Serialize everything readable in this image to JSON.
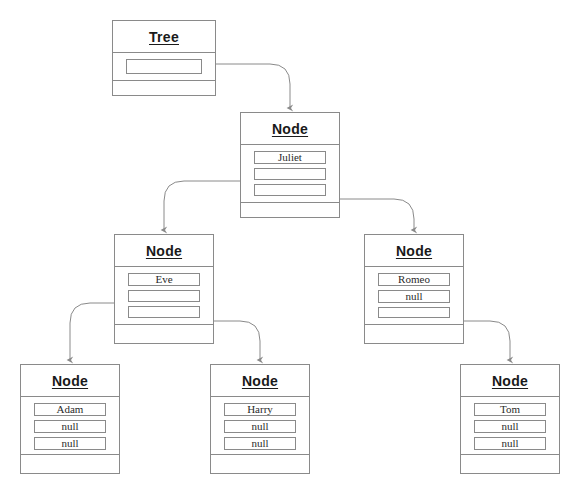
{
  "diagram": {
    "background_color": "#ffffff",
    "border_color": "#8a8a8a",
    "connector_color": "#8a8a8a",
    "text_color": "#1a1a1a",
    "width": 578,
    "height": 492
  },
  "boxes": [
    {
      "id": "tree-root",
      "title": "Tree",
      "x": 112,
      "y": 20,
      "w": 104,
      "h": 76,
      "fields_h": 28,
      "fields": [
        {
          "text": "",
          "kind": "pointer"
        }
      ]
    },
    {
      "id": "node-juliet",
      "title": "Node",
      "x": 240,
      "y": 112,
      "w": 100,
      "h": 106,
      "fields_h": 58,
      "fields": [
        {
          "text": "Juliet",
          "kind": "value"
        },
        {
          "text": "",
          "kind": "pointer"
        },
        {
          "text": "",
          "kind": "pointer"
        }
      ]
    },
    {
      "id": "node-eve",
      "title": "Node",
      "x": 114,
      "y": 234,
      "w": 100,
      "h": 110,
      "fields_h": 58,
      "fields": [
        {
          "text": "Eve",
          "kind": "value"
        },
        {
          "text": "",
          "kind": "pointer"
        },
        {
          "text": "",
          "kind": "pointer"
        }
      ]
    },
    {
      "id": "node-romeo",
      "title": "Node",
      "x": 364,
      "y": 234,
      "w": 100,
      "h": 110,
      "fields_h": 58,
      "fields": [
        {
          "text": "Romeo",
          "kind": "value"
        },
        {
          "text": "null",
          "kind": "value"
        },
        {
          "text": "",
          "kind": "pointer"
        }
      ]
    },
    {
      "id": "node-adam",
      "title": "Node",
      "x": 20,
      "y": 364,
      "w": 100,
      "h": 110,
      "fields_h": 58,
      "fields": [
        {
          "text": "Adam",
          "kind": "value"
        },
        {
          "text": "null",
          "kind": "value"
        },
        {
          "text": "null",
          "kind": "value"
        }
      ]
    },
    {
      "id": "node-harry",
      "title": "Node",
      "x": 210,
      "y": 364,
      "w": 100,
      "h": 110,
      "fields_h": 58,
      "fields": [
        {
          "text": "Harry",
          "kind": "value"
        },
        {
          "text": "null",
          "kind": "value"
        },
        {
          "text": "null",
          "kind": "value"
        }
      ]
    },
    {
      "id": "node-tom",
      "title": "Node",
      "x": 460,
      "y": 364,
      "w": 100,
      "h": 110,
      "fields_h": 58,
      "fields": [
        {
          "text": "Tom",
          "kind": "value"
        },
        {
          "text": "null",
          "kind": "value"
        },
        {
          "text": "null",
          "kind": "value"
        }
      ]
    }
  ],
  "connectors": [
    {
      "id": "tree-to-juliet",
      "from": "tree-root",
      "to": "node-juliet",
      "path": "M 216 64 L 270 64 Q 290 64 290 84 L 290 108"
    },
    {
      "id": "juliet-to-eve",
      "from": "node-juliet",
      "to": "node-eve",
      "path": "M 240 181 L 184 181 Q 164 181 164 201 L 164 230"
    },
    {
      "id": "juliet-to-romeo",
      "from": "node-juliet",
      "to": "node-romeo",
      "path": "M 340 199 L 394 199 Q 414 199 414 219 L 414 230"
    },
    {
      "id": "eve-to-adam",
      "from": "node-eve",
      "to": "node-adam",
      "path": "M 114 303 L 90 303 Q 70 303 70 323 L 70 360"
    },
    {
      "id": "eve-to-harry",
      "from": "node-eve",
      "to": "node-harry",
      "path": "M 214 321 L 240 321 Q 260 321 260 341 L 260 360"
    },
    {
      "id": "romeo-to-tom",
      "from": "node-romeo",
      "to": "node-tom",
      "path": "M 464 321 L 490 321 Q 510 321 510 341 L 510 360"
    }
  ]
}
